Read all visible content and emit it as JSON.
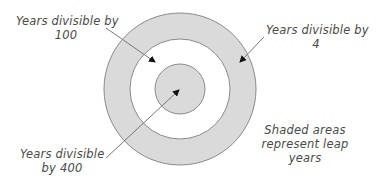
{
  "diagram": {
    "type": "concentric-circles",
    "colors": {
      "shaded": "#dadada",
      "stroke": "#8a8a8a",
      "background": "#ffffff",
      "text": "#4a4a4a"
    },
    "circles": [
      {
        "name": "divisible-by-4",
        "shaded": true
      },
      {
        "name": "divisible-by-100",
        "shaded": false
      },
      {
        "name": "divisible-by-400",
        "shaded": true
      }
    ],
    "labels": {
      "by100_line1": "Years divisible by",
      "by100_line2": "100",
      "by4_line1": "Years divisible by",
      "by4_line2": "4",
      "by400_line1": "Years  divisible",
      "by400_line2": "by 400",
      "legend_line1": "Shaded areas",
      "legend_line2": "represent leap",
      "legend_line3": "years"
    }
  }
}
